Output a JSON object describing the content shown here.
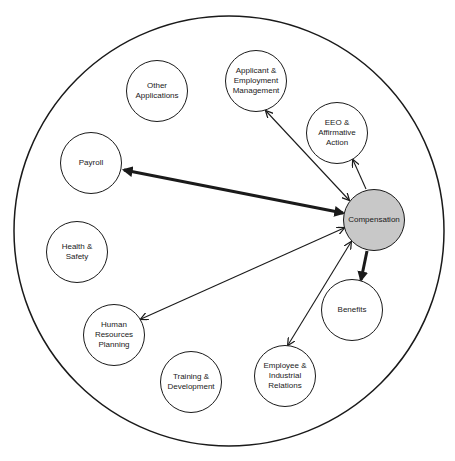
{
  "diagram": {
    "type": "hub-and-spoke",
    "outer_boundary": {
      "cx": 229,
      "cy": 231,
      "r": 215
    },
    "hub": {
      "id": "compensation",
      "label": "Compensation",
      "cx": 374,
      "cy": 220,
      "fill": "#c8c8c8"
    },
    "nodes": [
      {
        "id": "other-applications",
        "label": "Other\nApplications",
        "cx": 157,
        "cy": 91
      },
      {
        "id": "applicant-employment-management",
        "label": "Applicant  &\nEmployment\nManagement",
        "cx": 256,
        "cy": 81
      },
      {
        "id": "eeo-affirmative-action",
        "label": "EEO &\nAffirmative\nAction",
        "cx": 337,
        "cy": 133
      },
      {
        "id": "payroll",
        "label": "Payroll",
        "cx": 91,
        "cy": 163
      },
      {
        "id": "health-safety",
        "label": "Health &\nSafety",
        "cx": 77,
        "cy": 252
      },
      {
        "id": "benefits",
        "label": "Benefits",
        "cx": 352,
        "cy": 310
      },
      {
        "id": "human-resources-planning",
        "label": "Human\nResources\nPlanning",
        "cx": 114,
        "cy": 335
      },
      {
        "id": "training-development",
        "label": "Training &\nDevelopment",
        "cx": 191,
        "cy": 382
      },
      {
        "id": "employee-industrial-relations",
        "label": "Employee &\nIndustrial\nRelations",
        "cx": 285,
        "cy": 376
      }
    ],
    "edges": [
      {
        "from": "compensation",
        "to": "payroll",
        "direction": "both",
        "weight": "heavy"
      },
      {
        "from": "compensation",
        "to": "applicant-employment-management",
        "direction": "both",
        "weight": "thin"
      },
      {
        "from": "compensation",
        "to": "eeo-affirmative-action",
        "direction": "to",
        "weight": "thin"
      },
      {
        "from": "compensation",
        "to": "benefits",
        "direction": "to",
        "weight": "heavy"
      },
      {
        "from": "compensation",
        "to": "human-resources-planning",
        "direction": "both",
        "weight": "thin"
      },
      {
        "from": "compensation",
        "to": "employee-industrial-relations",
        "direction": "both",
        "weight": "thin"
      }
    ]
  }
}
